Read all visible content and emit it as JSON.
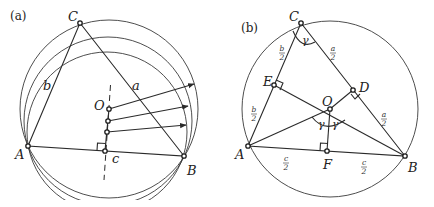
{
  "panels": [
    {
      "id": "a",
      "label": "(a)",
      "points": {
        "A": {
          "label": "A",
          "x": 28,
          "y": 146
        },
        "B": {
          "label": "B",
          "x": 184,
          "y": 156
        },
        "C": {
          "label": "C",
          "x": 80,
          "y": 23
        },
        "O": {
          "label": "O",
          "x": 109,
          "y": 109
        }
      },
      "side_labels": {
        "a": "a",
        "b": "b",
        "c": "c"
      },
      "centers": [
        {
          "x": 109,
          "y": 109,
          "r": 89
        },
        {
          "x": 108,
          "y": 121,
          "r": 84
        },
        {
          "x": 107,
          "y": 132,
          "r": 80
        }
      ],
      "bisector_foot": {
        "x": 105,
        "y": 151
      }
    },
    {
      "id": "b",
      "label": "(b)",
      "points": {
        "A": {
          "label": "A",
          "x": 248,
          "y": 146
        },
        "B": {
          "label": "B",
          "x": 405,
          "y": 156
        },
        "C": {
          "label": "C",
          "x": 301,
          "y": 23
        },
        "D": {
          "label": "D",
          "x": 353,
          "y": 90
        },
        "E": {
          "label": "E",
          "x": 274,
          "y": 85
        },
        "F": {
          "label": "F",
          "x": 327,
          "y": 151
        },
        "O": {
          "label": "O",
          "x": 330,
          "y": 109
        }
      },
      "circumcircle": {
        "x": 330,
        "y": 109,
        "r": 88
      },
      "half_labels": {
        "b_half_num": "b",
        "a_half_num": "a",
        "c_half_num": "c",
        "den": "2"
      },
      "angle_label": "γ"
    }
  ]
}
